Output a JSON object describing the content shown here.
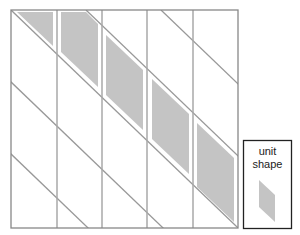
{
  "diagram": {
    "type": "tiling-diagram",
    "grid": {
      "left": 11,
      "top": 10,
      "right": 238,
      "bottom": 228,
      "columns": 5,
      "column_x": [
        11,
        57,
        102,
        147,
        193,
        238
      ],
      "diagonal_slope": 0.96,
      "diagonal_spacing": 75,
      "line_color": "#999999",
      "border_color": "#888888"
    },
    "shaded_tiles": {
      "fill": "#c4c4c4",
      "count": 5,
      "description": "parallelogram tiles placed along one diagonal band, one per column"
    },
    "legend": {
      "label_line1": "unit",
      "label_line2": "shape",
      "box_border_color": "#222222",
      "shape_fill": "#c4c4c4"
    }
  }
}
